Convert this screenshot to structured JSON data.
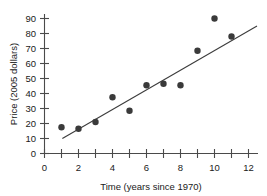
{
  "chart_data": {
    "type": "scatter",
    "title": "",
    "xlabel": "Time (years since 1970)",
    "ylabel": "Price (2005 dollars)",
    "xlim": [
      0,
      12.6
    ],
    "ylim": [
      0,
      95
    ],
    "grid": false,
    "legend": null,
    "x_ticks_major": [
      0,
      2,
      4,
      6,
      8,
      10,
      12
    ],
    "x_ticks_minor": [
      1,
      3,
      5,
      7,
      9,
      11
    ],
    "x_tick_labels": [
      "0",
      "2",
      "4",
      "6",
      "8",
      "10",
      "12"
    ],
    "y_ticks": [
      0,
      10,
      20,
      30,
      40,
      50,
      60,
      70,
      80,
      90
    ],
    "y_tick_labels": [
      "0",
      "10",
      "20",
      "30",
      "40",
      "50",
      "60",
      "70",
      "80",
      "90"
    ],
    "x": [
      1,
      2,
      3,
      4,
      5,
      6,
      7,
      8,
      9,
      10,
      11
    ],
    "y": [
      17.5,
      16.5,
      21,
      37.5,
      28.5,
      45.5,
      46.5,
      45.5,
      68.5,
      90,
      78
    ],
    "points": [
      {
        "x": 1,
        "y": 17.5
      },
      {
        "x": 2,
        "y": 16.5
      },
      {
        "x": 3,
        "y": 21
      },
      {
        "x": 4,
        "y": 37.5
      },
      {
        "x": 5,
        "y": 28.5
      },
      {
        "x": 6,
        "y": 45.5
      },
      {
        "x": 7,
        "y": 46.5
      },
      {
        "x": 8,
        "y": 45.5
      },
      {
        "x": 9,
        "y": 68.5
      },
      {
        "x": 10,
        "y": 90
      },
      {
        "x": 11,
        "y": 78
      }
    ],
    "trend_line": {
      "x_start": 1.05,
      "y_start": 10,
      "x_end": 12.5,
      "y_end": 85
    },
    "colors": {
      "point": "#3a3a3a",
      "line": "#3c3c3c",
      "axis": "#4a4a4a",
      "text": "#1a1a1a",
      "background": "#ffffff"
    }
  }
}
